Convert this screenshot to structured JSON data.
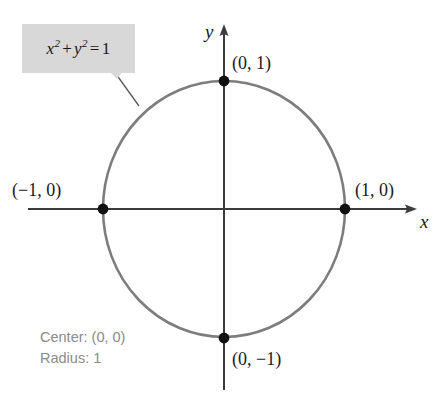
{
  "figure": {
    "type": "analytic-geometry-graph",
    "equation": {
      "full": "x² + y² = 1",
      "lhs_term_1_base": "x",
      "lhs_term_1_exp": "2",
      "operator": "+",
      "lhs_term_2_base": "y",
      "lhs_term_2_exp": "2",
      "equals": "=",
      "rhs": "1"
    },
    "axes": {
      "x_label": "x",
      "y_label": "y"
    },
    "caption": {
      "center": "Center: (0, 0)",
      "radius": "Radius: 1"
    },
    "points": [
      {
        "name": "top",
        "label": "(0, 1)",
        "x": 0,
        "y": 1
      },
      {
        "name": "right",
        "label": "(1, 0)",
        "x": 1,
        "y": 0
      },
      {
        "name": "left",
        "label": "(−1, 0)",
        "x": -1,
        "y": 0
      },
      {
        "name": "bottom",
        "label": "(0, −1)",
        "x": 0,
        "y": -1
      }
    ],
    "colors": {
      "circle_stroke": "#7d7d7d",
      "axis_stroke": "#3c3c3c",
      "point_fill": "#111111",
      "callout_fill": "#d8d8d8",
      "caption_text": "#8b8b8b",
      "label_text": "#1a1a1a",
      "background": "#ffffff"
    },
    "geometry": {
      "center_px": [
        224,
        209
      ],
      "radius_x_px": 121,
      "radius_y_px": 128
    }
  }
}
